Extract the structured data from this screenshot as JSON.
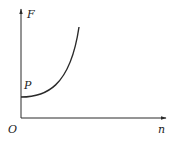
{
  "diagram": {
    "type": "function-graph",
    "y_axis_label": "F",
    "x_axis_label": "n",
    "origin_label": "O",
    "point_label": "P",
    "colors": {
      "stroke": "#2a2a2a",
      "background": "#ffffff"
    },
    "curve": {
      "description": "increasing convex curve starting at point P on the F-axis (flat slope), rising steeply",
      "start": [
        21,
        97
      ],
      "control": [
        60,
        97
      ],
      "end": [
        79,
        27
      ]
    }
  }
}
